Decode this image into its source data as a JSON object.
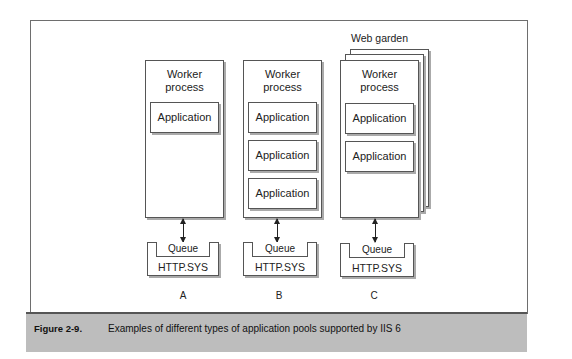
{
  "figure": {
    "label": "Figure 2-9.",
    "caption": "Examples of different types of application pools supported by IIS 6"
  },
  "pools": [
    {
      "letter": "A",
      "worker_title": "Worker\nprocess",
      "applications": [
        "Application"
      ],
      "queue": "Queue",
      "http": "HTTP.SYS"
    },
    {
      "letter": "B",
      "worker_title": "Worker\nprocess",
      "applications": [
        "Application",
        "Application",
        "Application"
      ],
      "queue": "Queue",
      "http": "HTTP.SYS"
    },
    {
      "letter": "C",
      "group_label": "Web garden",
      "worker_title": "Worker\nprocess",
      "applications": [
        "Application",
        "Application"
      ],
      "queue": "Queue",
      "http": "HTTP.SYS"
    }
  ]
}
